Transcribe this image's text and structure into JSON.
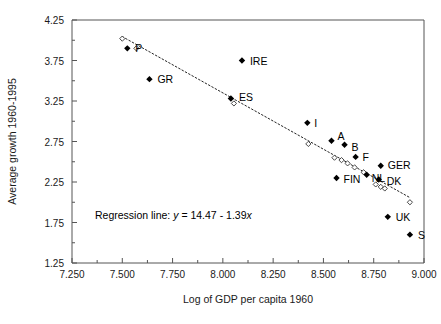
{
  "chart_data": {
    "type": "scatter",
    "title": "",
    "xlabel": "Log of GDP per capita 1960",
    "ylabel": "Average growth 1960-1995",
    "xlim": [
      7.25,
      9.0
    ],
    "ylim": [
      1.25,
      4.25
    ],
    "xticks": [
      "7.250",
      "7.500",
      "7.750",
      "8.000",
      "8.250",
      "8.500",
      "8.750",
      "9.000"
    ],
    "xtick_values": [
      7.25,
      7.5,
      7.75,
      8.0,
      8.25,
      8.5,
      8.75,
      9.0
    ],
    "yticks": [
      "1.25",
      "1.75",
      "2.25",
      "2.75",
      "3.25",
      "3.75",
      "4.25"
    ],
    "ytick_values": [
      1.25,
      1.75,
      2.25,
      2.75,
      3.25,
      3.75,
      4.25
    ],
    "minor_tick_step_x": 0.125,
    "minor_tick_step_y": 0.25,
    "grid": false,
    "legend": "none",
    "annotation": "Regression line:  y = 14.47 - 1.39x",
    "annotation_prefix": "Regression line:",
    "annotation_y": "y",
    "annotation_eq_mid": "= 14.47 - 1.39",
    "annotation_x": "x",
    "regression": {
      "intercept": 14.47,
      "slope": -1.39,
      "x_start": 7.5,
      "x_end": 8.93
    },
    "points": [
      {
        "label": "P",
        "x": 7.525,
        "y": 3.9,
        "marker": "filled",
        "label_dx": 8,
        "label_dy": 4
      },
      {
        "label": "GR",
        "x": 7.635,
        "y": 3.52,
        "marker": "filled",
        "label_dx": 8,
        "label_dy": 4
      },
      {
        "label": "IRE",
        "x": 8.095,
        "y": 3.75,
        "marker": "filled",
        "label_dx": 8,
        "label_dy": 4
      },
      {
        "label": "ES",
        "x": 8.04,
        "y": 3.28,
        "marker": "filled",
        "label_dx": 8,
        "label_dy": 2
      },
      {
        "label": "I",
        "x": 8.42,
        "y": 2.98,
        "marker": "filled",
        "label_dx": 7,
        "label_dy": 4
      },
      {
        "label": "A",
        "x": 8.54,
        "y": 2.76,
        "marker": "filled",
        "label_dx": 6,
        "label_dy": -1
      },
      {
        "label": "B",
        "x": 8.605,
        "y": 2.71,
        "marker": "filled",
        "label_dx": 7,
        "label_dy": 6
      },
      {
        "label": "F",
        "x": 8.66,
        "y": 2.56,
        "marker": "filled",
        "label_dx": 7,
        "label_dy": 4
      },
      {
        "label": "GER",
        "x": 8.785,
        "y": 2.45,
        "marker": "filled",
        "label_dx": 7,
        "label_dy": 3
      },
      {
        "label": "FIN",
        "x": 8.565,
        "y": 2.3,
        "marker": "filled",
        "label_dx": 7,
        "label_dy": 5
      },
      {
        "label": "NL",
        "x": 8.715,
        "y": 2.34,
        "marker": "filled",
        "label_dx": 5,
        "label_dy": 7
      },
      {
        "label": "DK",
        "x": 8.775,
        "y": 2.28,
        "marker": "filled",
        "label_dx": 8,
        "label_dy": 5
      },
      {
        "label": "UK",
        "x": 8.82,
        "y": 1.82,
        "marker": "filled",
        "label_dx": 8,
        "label_dy": 4
      },
      {
        "label": "S",
        "x": 8.93,
        "y": 1.6,
        "marker": "filled",
        "label_dx": 8,
        "label_dy": 4
      }
    ],
    "fitted_points": [
      {
        "x": 7.5,
        "y": 4.02,
        "marker": "open"
      },
      {
        "x": 7.57,
        "y": 3.9,
        "marker": "open"
      },
      {
        "x": 8.055,
        "y": 3.22,
        "marker": "open"
      },
      {
        "x": 8.425,
        "y": 2.72,
        "marker": "open"
      },
      {
        "x": 8.555,
        "y": 2.55,
        "marker": "open"
      },
      {
        "x": 8.59,
        "y": 2.52,
        "marker": "open"
      },
      {
        "x": 8.62,
        "y": 2.48,
        "marker": "open"
      },
      {
        "x": 8.655,
        "y": 2.43,
        "marker": "open"
      },
      {
        "x": 8.7,
        "y": 2.37,
        "marker": "open"
      },
      {
        "x": 8.76,
        "y": 2.22,
        "marker": "open"
      },
      {
        "x": 8.785,
        "y": 2.19,
        "marker": "open"
      },
      {
        "x": 8.805,
        "y": 2.17,
        "marker": "open"
      },
      {
        "x": 8.93,
        "y": 2.0,
        "marker": "open"
      }
    ]
  }
}
